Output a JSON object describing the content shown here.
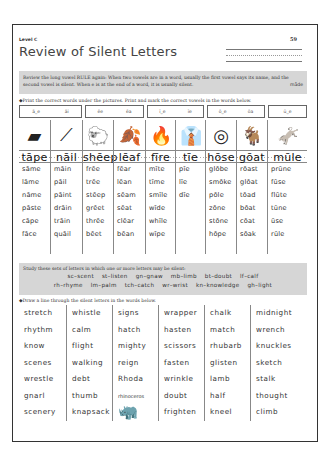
{
  "header": {
    "level": "Level C",
    "page_number": "59",
    "title": "Review of Silent Letters"
  },
  "rule": {
    "text": "Review the long vowel RULE again: When two vowels are in a word, usually the first vowel says its name, and the second vowel is silent. When e is at the end of a word, it is usually silent.",
    "example": "māde"
  },
  "instructions": {
    "part1": "◆Print the correct words under the pictures. Print and mark the correct vowels in the words below.",
    "part2": "◆Draw a line through the silent letters in the words below."
  },
  "hint_boxes": [
    {
      "left": 0,
      "width": 63,
      "items": [
        "ā_e",
        "āi"
      ]
    },
    {
      "left": 66,
      "width": 59,
      "items": [
        "ēe",
        "ēa"
      ]
    },
    {
      "left": 128,
      "width": 57,
      "items": [
        "ī_e",
        "īe"
      ]
    },
    {
      "left": 188,
      "width": 58,
      "items": [
        "ō_e",
        "ōa"
      ]
    },
    {
      "left": 249,
      "width": 39,
      "items": [
        "ū_e"
      ]
    }
  ],
  "picture_columns": [
    {
      "left": 0,
      "width": 31,
      "picture": "tape-dispenser",
      "glyph": "▰",
      "answer": "tāpe",
      "words": [
        "sāme",
        "lāme",
        "nāme",
        "pāste",
        "cāpe",
        "fāce"
      ]
    },
    {
      "left": 31,
      "width": 32,
      "picture": "nail",
      "glyph": "⟋",
      "answer": "nāil",
      "words": [
        "māin",
        "pāil",
        "pāint",
        "drāin",
        "trāin",
        "quāil"
      ]
    },
    {
      "left": 63,
      "width": 31,
      "picture": "sheep",
      "glyph": "🐑",
      "answer": "shēep",
      "words": [
        "frēe",
        "trēe",
        "stēep",
        "grēet",
        "thrēe",
        "bēet"
      ]
    },
    {
      "left": 94,
      "width": 32,
      "picture": "leaf",
      "glyph": "🍂",
      "answer": "lēaf",
      "words": [
        "fēar",
        "lēan",
        "sēam",
        "sēat",
        "clēar",
        "bēan"
      ]
    },
    {
      "left": 126,
      "width": 30,
      "picture": "fire",
      "glyph": "🔥",
      "answer": "fīre",
      "words": [
        "mīte",
        "tīme",
        "smīle",
        "wīde",
        "whīle",
        "wīpe"
      ]
    },
    {
      "left": 156,
      "width": 30,
      "picture": "tie",
      "glyph": "👔",
      "answer": "tīe",
      "words": [
        "pīe",
        "līe",
        "dīe",
        "",
        "",
        ""
      ]
    },
    {
      "left": 186,
      "width": 31,
      "picture": "hose",
      "glyph": "◎",
      "answer": "hōse",
      "words": [
        "glōbe",
        "smōke",
        "pōle",
        "zōne",
        "stōne",
        "hōpe"
      ]
    },
    {
      "left": 217,
      "width": 31,
      "picture": "goat",
      "glyph": "🐐",
      "answer": "gōat",
      "words": [
        "rōast",
        "glōat",
        "tōad",
        "bōat",
        "cōat",
        "sōak"
      ]
    },
    {
      "left": 248,
      "width": 40,
      "picture": "mule",
      "glyph": "🫏",
      "answer": "mūle",
      "words": [
        "prūne",
        "fūse",
        "flūte",
        "tūne",
        "ūse",
        "rūle"
      ]
    }
  ],
  "study": {
    "text": "Study these sets of letters in which one or more letters may be silent:",
    "row1": [
      "sc–scent",
      "st–listen",
      "gn–gnaw",
      "mb–limb",
      "bt–doubt",
      "lf–calf"
    ],
    "row2": [
      "rh–rhyme",
      "lm–palm",
      "tch–catch",
      "wr–wrist",
      "kn–knowledge",
      "gh–light"
    ]
  },
  "silent_columns": [
    {
      "left": 0,
      "width": 47,
      "words": [
        "stretch",
        "rhythm",
        "know",
        "scenes",
        "wrestle",
        "gnarl",
        "scenery"
      ]
    },
    {
      "left": 47,
      "width": 46,
      "words": [
        "whistle",
        "calm",
        "flight",
        "walking",
        "debt",
        "thumb",
        "knapsack"
      ]
    },
    {
      "left": 93,
      "width": 46,
      "words": [
        "signs",
        "hatch",
        "mighty",
        "reign",
        "Rhoda",
        "rhinoceros",
        ""
      ]
    },
    {
      "left": 139,
      "width": 46,
      "words": [
        "wrapper",
        "hasten",
        "scissors",
        "fasten",
        "wrinkle",
        "doubt",
        "frighten"
      ]
    },
    {
      "left": 185,
      "width": 46,
      "words": [
        "chalk",
        "match",
        "rhubarb",
        "glisten",
        "lamb",
        "half",
        "kneel"
      ]
    },
    {
      "left": 231,
      "width": 57,
      "words": [
        "midnight",
        "wrench",
        "knuckles",
        "sketch",
        "stalk",
        "thought",
        "climb"
      ]
    }
  ],
  "rhino_picture": "🦏"
}
